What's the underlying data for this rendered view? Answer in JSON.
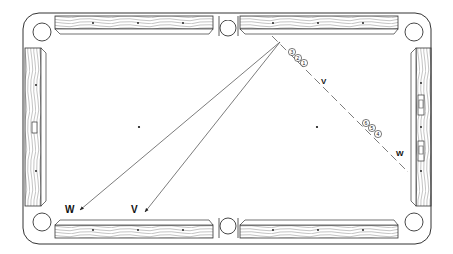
{
  "diagram": {
    "type": "billiards-table-shot-diagram",
    "table": {
      "outer": {
        "x": 23,
        "y": 13,
        "w": 408,
        "h": 231
      },
      "playfield": {
        "x": 58,
        "y": 38,
        "w": 350,
        "h": 176
      },
      "pockets": [
        {
          "name": "top-left",
          "cx": 42,
          "cy": 32
        },
        {
          "name": "top-middle",
          "cx": 229,
          "cy": 28
        },
        {
          "name": "top-right",
          "cx": 414,
          "cy": 32
        },
        {
          "name": "bottom-left",
          "cx": 42,
          "cy": 222
        },
        {
          "name": "bottom-middle",
          "cx": 229,
          "cy": 226
        },
        {
          "name": "bottom-right",
          "cx": 414,
          "cy": 222
        }
      ],
      "spots": [
        {
          "cx": 139,
          "cy": 127
        },
        {
          "cx": 317,
          "cy": 127
        }
      ]
    },
    "balls": [
      {
        "number": "3",
        "cx": 292,
        "cy": 52
      },
      {
        "number": "2",
        "cx": 298,
        "cy": 58
      },
      {
        "number": "1",
        "cx": 304,
        "cy": 63
      },
      {
        "number": "6",
        "cx": 366,
        "cy": 123
      },
      {
        "number": "5",
        "cx": 372,
        "cy": 128
      },
      {
        "number": "4",
        "cx": 378,
        "cy": 134
      }
    ],
    "labels": {
      "v_upper": "V",
      "w_right": "W",
      "w_bottom": "W",
      "v_bottom": "V"
    },
    "paths": {
      "apex": {
        "x": 280,
        "y": 42
      },
      "w_target": {
        "x": 80,
        "y": 210
      },
      "v_target": {
        "x": 145,
        "y": 212
      },
      "dashed_end": {
        "x": 408,
        "y": 172
      }
    }
  }
}
